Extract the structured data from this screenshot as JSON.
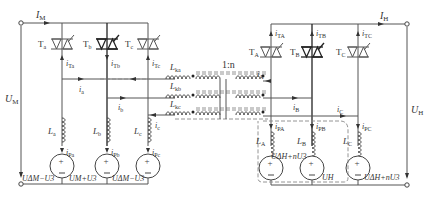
{
  "diagram": {
    "left_side": {
      "terminal_current": {
        "main": "I",
        "sub": "M"
      },
      "terminal_voltage": {
        "main": "U",
        "sub": "M"
      },
      "thyristors": [
        {
          "main": "T",
          "sub": "a"
        },
        {
          "main": "T",
          "sub": "b"
        },
        {
          "main": "T",
          "sub": "c"
        }
      ],
      "thyristor_currents": [
        {
          "main": "i",
          "sub": "Ta"
        },
        {
          "main": "i",
          "sub": "Tb"
        },
        {
          "main": "i",
          "sub": "Tc"
        }
      ],
      "branch_currents": [
        {
          "main": "i",
          "sub": "a"
        },
        {
          "main": "i",
          "sub": "b"
        },
        {
          "main": "i",
          "sub": "c"
        }
      ],
      "inductors": [
        {
          "main": "L",
          "sub": "a"
        },
        {
          "main": "L",
          "sub": "b"
        },
        {
          "main": "L",
          "sub": "c"
        }
      ],
      "source_currents": [
        {
          "main": "i",
          "sub": "Pa"
        },
        {
          "main": "i",
          "sub": "Pb"
        },
        {
          "main": "i",
          "sub": "Pc"
        }
      ],
      "source_voltages": [
        "UΔM−U3",
        "UM+U3",
        "UΔM−U3"
      ]
    },
    "transformer": {
      "ratio": "1:n",
      "leakage_inductors": [
        {
          "main": "L",
          "sub": "ka"
        },
        {
          "main": "L",
          "sub": "kb"
        },
        {
          "main": "L",
          "sub": "kc"
        }
      ]
    },
    "right_side": {
      "terminal_current": {
        "main": "I",
        "sub": "H"
      },
      "terminal_voltage": {
        "main": "U",
        "sub": "H"
      },
      "thyristors": [
        {
          "main": "T",
          "sub": "A"
        },
        {
          "main": "T",
          "sub": "B"
        },
        {
          "main": "T",
          "sub": "C"
        }
      ],
      "thyristor_currents": [
        {
          "main": "i",
          "sub": "TA"
        },
        {
          "main": "i",
          "sub": "TB"
        },
        {
          "main": "i",
          "sub": "TC"
        }
      ],
      "branch_currents": [
        {
          "main": "i",
          "sub": "A"
        },
        {
          "main": "i",
          "sub": "B"
        },
        {
          "main": "i",
          "sub": "C"
        }
      ],
      "inductors": [
        {
          "main": "L",
          "sub": "A"
        },
        {
          "main": "L",
          "sub": "B"
        },
        {
          "main": "L",
          "sub": "C"
        }
      ],
      "source_currents": [
        {
          "main": "i",
          "sub": "PA"
        },
        {
          "main": "i",
          "sub": "PB"
        },
        {
          "main": "i",
          "sub": "PC"
        }
      ],
      "source_voltages": [
        "UΔH+nU3",
        "UH",
        "UΔH+nU3"
      ]
    }
  }
}
